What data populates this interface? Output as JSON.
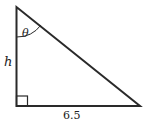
{
  "figure": {
    "type": "right-triangle",
    "labels": {
      "angle": "θ",
      "vertical_side": "h",
      "horizontal_side": "6.5"
    },
    "colors": {
      "stroke": "#2a2a2a",
      "background": "#ffffff"
    }
  }
}
